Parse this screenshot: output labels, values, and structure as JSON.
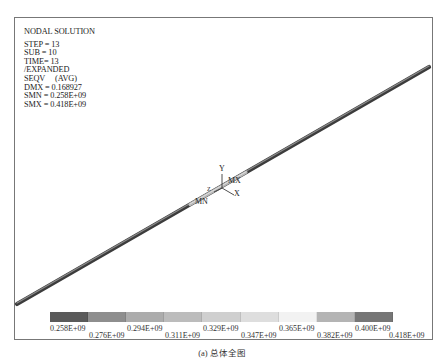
{
  "plot": {
    "title": "NODAL SOLUTION",
    "info_lines": [
      "STEP = 13",
      "SUB = 10",
      "TIME= 13",
      "/EXPANDED",
      "SEQV     (AVG)",
      "DMX = 0.168927",
      "SMN = 0.258E+09",
      "SMX = 0.418E+09"
    ],
    "markers": {
      "max": "MX",
      "min": "MN"
    },
    "axes": {
      "x": "X",
      "y": "Y",
      "z": "Z"
    }
  },
  "legend": {
    "colors": [
      "#5a5a5a",
      "#8e8e8e",
      "#aeaeae",
      "#c0c0c0",
      "#d2d2d2",
      "#e4e4e4",
      "#f4f4f4",
      "#bdbdbd",
      "#7a7a7a"
    ],
    "top_labels": [
      "0.258E+09",
      "0.294E+09",
      "0.329E+09",
      "0.365E+09",
      "0.400E+09"
    ],
    "bottom_labels": [
      "0.276E+09",
      "0.311E+09",
      "0.347E+09",
      "0.382E+09",
      "0.418E+09"
    ]
  },
  "caption": "(a) 总体全图"
}
